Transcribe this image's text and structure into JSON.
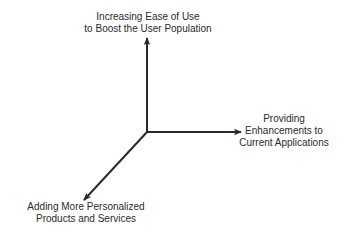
{
  "diagram": {
    "type": "three-axis-growth-diagram",
    "origin": {
      "x": 147,
      "y": 132
    },
    "stroke_color": "#2a2a2a",
    "background": "#ffffff",
    "axes": [
      {
        "id": "up",
        "direction": "up",
        "end": {
          "x": 147,
          "y": 38
        },
        "label_lines": [
          "Increasing Ease of Use",
          "to Boost the User Population"
        ]
      },
      {
        "id": "right",
        "direction": "right",
        "end": {
          "x": 241,
          "y": 132
        },
        "label_lines": [
          "Providing",
          "Enhancements to",
          "Current Applications"
        ]
      },
      {
        "id": "down-left",
        "direction": "down-left",
        "end": {
          "x": 84,
          "y": 200
        },
        "label_lines": [
          "Adding More Personalized",
          "Products and Services"
        ]
      }
    ]
  }
}
